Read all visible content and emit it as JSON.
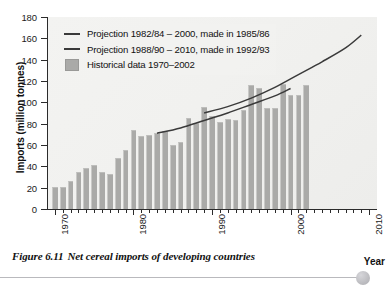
{
  "figure": {
    "number": "Figure 6.11",
    "caption": "Net cereal imports of developing countries"
  },
  "legend": {
    "items": [
      {
        "key": "line",
        "label": "Projection 1982/84 – 2000, made in 1985/86"
      },
      {
        "key": "line",
        "label": "Projection 1988/90 – 2010, made in 1992/93"
      },
      {
        "key": "swatch",
        "label": "Historical data 1970–2002"
      }
    ]
  },
  "colors": {
    "bar": "#aaaaa8",
    "line": "#3a3a3a",
    "axis": "#2b2b2b",
    "plot_background": "#f1f1ef",
    "page_background": "#ffffff"
  },
  "chart_data": {
    "type": "bar",
    "title": "Net cereal imports of developing countries",
    "xlabel": "Year",
    "ylabel": "Imports (million tonnes)",
    "ylim": [
      0,
      180
    ],
    "ytick_step": 20,
    "yticks": [
      0,
      20,
      40,
      60,
      80,
      100,
      120,
      140,
      160,
      180
    ],
    "xlim": [
      1969,
      2011
    ],
    "xticks_major": [
      1970,
      1980,
      1990,
      2000,
      2010
    ],
    "xtick_minor_step": 1,
    "grid": false,
    "legend_position": "top-left",
    "categories": [
      1970,
      1971,
      1972,
      1973,
      1974,
      1975,
      1976,
      1977,
      1978,
      1979,
      1980,
      1981,
      1982,
      1983,
      1984,
      1985,
      1986,
      1987,
      1988,
      1989,
      1990,
      1991,
      1992,
      1993,
      1994,
      1995,
      1996,
      1997,
      1998,
      1999,
      2000,
      2001,
      2002
    ],
    "values": [
      21,
      21,
      26,
      35,
      38,
      41,
      35,
      33,
      48,
      55,
      74,
      68,
      69,
      71,
      73,
      60,
      63,
      85,
      81,
      96,
      87,
      82,
      84,
      83,
      93,
      116,
      113,
      95,
      95,
      117,
      107,
      107,
      116
    ],
    "series": [
      {
        "name": "Historical data 1970–2002",
        "type": "bar",
        "values": [
          21,
          21,
          26,
          35,
          38,
          41,
          35,
          33,
          48,
          55,
          74,
          68,
          69,
          71,
          73,
          60,
          63,
          85,
          81,
          96,
          87,
          82,
          84,
          83,
          93,
          116,
          113,
          95,
          95,
          117,
          107,
          107,
          116
        ]
      },
      {
        "name": "Projection 1982/84 – 2000, made in 1985/86",
        "type": "line",
        "points": [
          [
            1983,
            71
          ],
          [
            1986,
            76
          ],
          [
            1989,
            83
          ],
          [
            1992,
            90
          ],
          [
            1995,
            98
          ],
          [
            1998,
            106
          ],
          [
            2000,
            113
          ]
        ]
      },
      {
        "name": "Projection 1988/90 – 2010, made in 1992/93",
        "type": "line",
        "points": [
          [
            1989,
            90
          ],
          [
            1992,
            96
          ],
          [
            1995,
            104
          ],
          [
            1998,
            114
          ],
          [
            2001,
            126
          ],
          [
            2004,
            138
          ],
          [
            2007,
            151
          ],
          [
            2009,
            163
          ]
        ]
      }
    ]
  }
}
